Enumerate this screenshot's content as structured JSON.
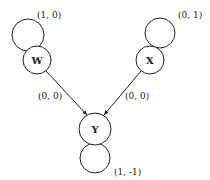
{
  "diagram": {
    "type": "state-graph",
    "colors": {
      "stroke": "#222222",
      "background": "#ffffff"
    },
    "nodes": [
      {
        "id": "W",
        "label": "W",
        "self_loop_label": "(1, 0)"
      },
      {
        "id": "X",
        "label": "X",
        "self_loop_label": "(0, 1)"
      },
      {
        "id": "Y",
        "label": "Y",
        "self_loop_label": "(1, -1)"
      }
    ],
    "edges": [
      {
        "from": "W",
        "to": "Y",
        "label": "(0, 0)"
      },
      {
        "from": "X",
        "to": "Y",
        "label": "(0, 0)"
      }
    ]
  }
}
